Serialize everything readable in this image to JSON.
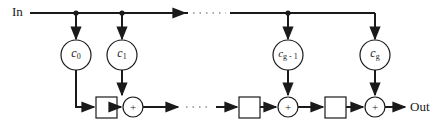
{
  "diagram": {
    "title": "",
    "input_label": "In",
    "output_label": "Out",
    "ellipsis": "· · ·",
    "coefficients": [
      {
        "name": "c",
        "subscript": "0"
      },
      {
        "name": "c",
        "subscript": "1"
      },
      {
        "name": "c",
        "subscript": "g - 1"
      },
      {
        "name": "c",
        "subscript": "g"
      }
    ],
    "adder_symbol": "+",
    "delay_elements_visible": 3,
    "adders_visible": 3,
    "colors": {
      "line": "#1a1a1a",
      "background": "#ffffff"
    }
  }
}
